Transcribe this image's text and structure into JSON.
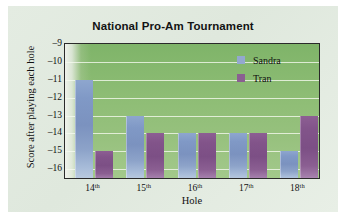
{
  "chart_data": {
    "type": "bar",
    "title": "National Pro-Am Tournament",
    "xlabel": "Hole",
    "ylabel": "Score after playing each hole",
    "categories": [
      "14th",
      "15th",
      "16th",
      "17th",
      "18th"
    ],
    "category_prefixes": [
      "14",
      "15",
      "16",
      "17",
      "18"
    ],
    "category_suffix": "th",
    "series": [
      {
        "name": "Sandra",
        "color": "#93a8cf",
        "values": [
          -11,
          -13,
          -14,
          -14,
          -15
        ]
      },
      {
        "name": "Tran",
        "color": "#8a5f91",
        "values": [
          -15,
          -14,
          -14,
          -14,
          -13
        ]
      }
    ],
    "yticks": [
      -9,
      -10,
      -11,
      -12,
      -13,
      -14,
      -15,
      -16
    ],
    "ytick_labels": [
      "–9",
      "–10",
      "–11",
      "–12",
      "–13",
      "–14",
      "–15",
      "–16"
    ],
    "ylim": [
      -16.6,
      -9
    ],
    "grid": true,
    "grid_axis": "y",
    "legend_position": "top-right",
    "plot_background": "#8ebd75",
    "figure_background": "#e4ece2"
  }
}
